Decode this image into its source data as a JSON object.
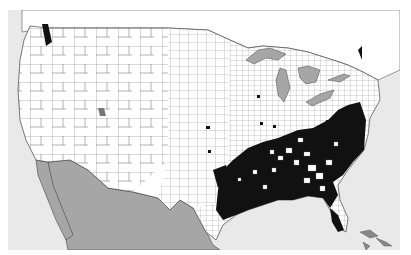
{
  "map": {
    "type": "choropleth",
    "region": "Contiguous United States counties",
    "colors": {
      "ocean": "#e9e9e9",
      "land": "#ffffff",
      "county_border": "#555555",
      "mexico": "#a6a6a6",
      "lakes": "#a6a6a6",
      "highlighted_county": "#111111"
    },
    "legend": null,
    "highlighted_region_description": "Dense cluster of highlighted (black) counties across the Southeastern US: Carolinas, Georgia, Alabama, Mississippi, Louisiana, east Texas, Arkansas, Tennessee, north Florida; scattered isolated counties in Midwest and Pacific Northwest"
  }
}
